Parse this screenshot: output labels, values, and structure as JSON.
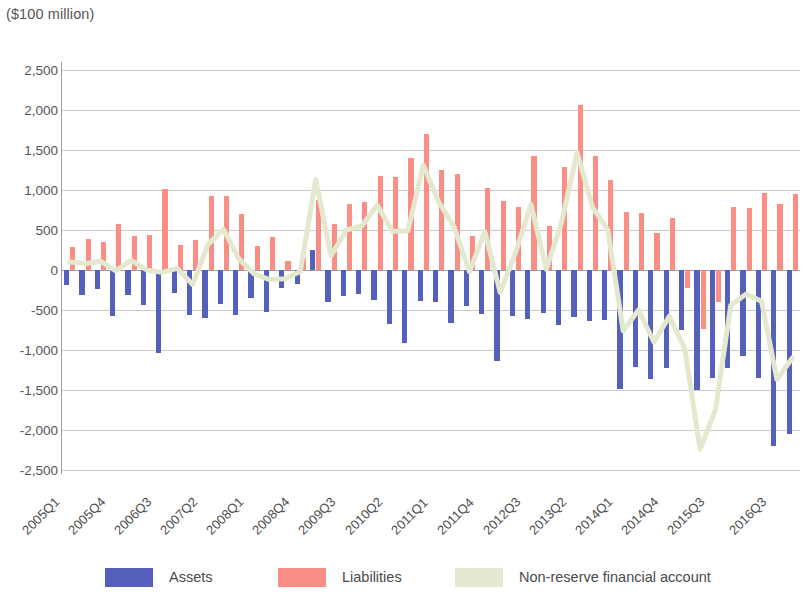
{
  "units_label": "($100 million)",
  "legend": {
    "items": [
      {
        "label": "Assets",
        "color": "#5560bd",
        "type": "bar"
      },
      {
        "label": "Liabilities",
        "color": "#fa8d84",
        "type": "bar"
      },
      {
        "label": "Non-reserve financial account",
        "color": "#e3e8ce",
        "type": "line"
      }
    ]
  },
  "chart_data": {
    "type": "bar",
    "title": "",
    "subtitle": "",
    "xlabel": "",
    "ylabel": "($100 million)",
    "ylim": [
      -2500,
      2500
    ],
    "ytick_step": 500,
    "ytick_labels": [
      "2,500",
      "2,000",
      "1,500",
      "1,000",
      "500",
      "0",
      "-500",
      "-1,000",
      "-1,500",
      "-2,000",
      "-2,500"
    ],
    "yticks": [
      2500,
      2000,
      1500,
      1000,
      500,
      0,
      -500,
      -1000,
      -1500,
      -2000,
      -2500
    ],
    "grid": true,
    "legend_position": "bottom",
    "stacked": false,
    "x": [
      "2005Q1",
      "2005Q2",
      "2005Q3",
      "2005Q4",
      "2006Q1",
      "2006Q2",
      "2006Q3",
      "2006Q4",
      "2007Q1",
      "2007Q2",
      "2007Q3",
      "2007Q4",
      "2008Q1",
      "2008Q2",
      "2008Q3",
      "2008Q4",
      "2009Q1",
      "2009Q2",
      "2009Q3",
      "2009Q4",
      "2010Q1",
      "2010Q2",
      "2010Q3",
      "2010Q4",
      "2011Q1",
      "2011Q2",
      "2011Q3",
      "2011Q4",
      "2012Q1",
      "2012Q2",
      "2012Q3",
      "2012Q4",
      "2013Q1",
      "2013Q2",
      "2013Q3",
      "2013Q4",
      "2014Q1",
      "2014Q2",
      "2014Q3",
      "2014Q4",
      "2015Q1",
      "2015Q2",
      "2015Q3",
      "2015Q4",
      "2016Q1",
      "2016Q2",
      "2016Q3",
      "2016Q4"
    ],
    "xtick_labels": [
      "2005Q1",
      "2005Q4",
      "2006Q3",
      "2007Q2",
      "2008Q1",
      "2008Q4",
      "2009Q3",
      "2010Q2",
      "2011Q1",
      "2011Q4",
      "2012Q3",
      "2013Q2",
      "2014Q1",
      "2014Q4",
      "2015Q3",
      "2016Q3"
    ],
    "xtick_indices": [
      0,
      3,
      6,
      9,
      12,
      15,
      18,
      21,
      24,
      27,
      30,
      33,
      36,
      39,
      42,
      46
    ],
    "series": [
      {
        "name": "Assets",
        "color": "#5560bd",
        "values": [
          -190,
          -310,
          -240,
          -580,
          -310,
          -440,
          -1040,
          -290,
          -560,
          -600,
          -420,
          -560,
          -350,
          -530,
          -220,
          -170,
          250,
          -400,
          -330,
          -300,
          -370,
          -680,
          -910,
          -390,
          -400,
          -660,
          -450,
          -550,
          -1140,
          -570,
          -610,
          -540,
          -690,
          -590,
          -640,
          -620,
          -1490,
          -1210,
          -1360,
          -1230,
          -750,
          -1500,
          -1350,
          -1230,
          -1070,
          -1350,
          -2200,
          -2050
        ]
      },
      {
        "name": "Liabilities",
        "color": "#fa8d84",
        "values": [
          290,
          390,
          350,
          570,
          430,
          440,
          1010,
          310,
          380,
          920,
          930,
          700,
          300,
          410,
          110,
          150,
          880,
          580,
          830,
          850,
          1180,
          1160,
          1400,
          1700,
          1250,
          1200,
          430,
          1030,
          860,
          790,
          1430,
          550,
          1290,
          2060,
          1430,
          1120,
          730,
          710,
          460,
          650,
          -230,
          -740,
          -400,
          790,
          770,
          960,
          830,
          950
        ]
      }
    ],
    "line_series": {
      "name": "Non-reserve financial account",
      "color": "#e3e8ce",
      "values": [
        100,
        80,
        110,
        -10,
        120,
        0,
        -30,
        20,
        -180,
        320,
        510,
        140,
        -50,
        -120,
        -110,
        -20,
        1130,
        180,
        500,
        550,
        810,
        480,
        490,
        1310,
        850,
        540,
        -20,
        480,
        -280,
        220,
        820,
        10,
        600,
        1470,
        790,
        500,
        -760,
        -500,
        -900,
        -580,
        -980,
        -2240,
        -1750,
        -440,
        -300,
        -390,
        -1370,
        -1100
      ]
    }
  }
}
